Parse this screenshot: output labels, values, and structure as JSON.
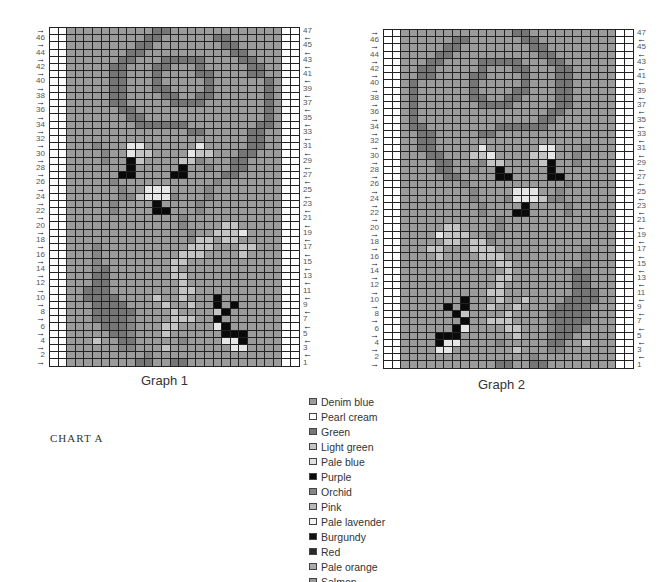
{
  "graphs": [
    {
      "id": "g1",
      "caption": "Graph 1",
      "left": 49,
      "mirror": false,
      "rows": [
        "aaaaaaaaaaddaaaaaaaaaaaaa",
        "aaaaaaaaaddaaaaaaddaaaaaa",
        "aaaaaaaaddaaaaaaaaddaaaaa",
        "aaaaaaaddaaaaaaaaaaddaaaa",
        "aaaaaaddaaadddddaaaaddaaa",
        "aaaaaddaaaddaaadaaaaaddaa",
        "aaaaaddaaadaaaaddaaaaddaa",
        "aaaaaddaaadaaaaadaaaaaada",
        "aaaaaddaaaddaaaadaaaaaada",
        "aaaaaddaaaaddaaddaaaaaada",
        "aaaaaddaaaaaddddaaaaaaada",
        "aaaaaaddaaaaaaaaaaaaaaada",
        "aaaaaaaddaaaaaaaaaaaaaada",
        "aaaaaaaaddddddaaaaaaaadda",
        "aaaaaaaaaaaaaaddaaaaaddaa",
        "aaaaaaaaaaaaaaaaaaaaaddaa",
        "aaamaaawwaaaaaawaaaaaddaa",
        "aaaamaawllaaaawllaaaddaaa",
        "aaaamaaklaaaallmaaaddaaaa",
        "aaaaaaakaaaaakaamaaddaaaa",
        "aaaaaakkaaaakkaaaaddaaaaa",
        "aaaaamaaaaaaaaaaamaaaaaaa",
        "aaaaaamaawwwaaaamaaaaaaaa",
        "aaaaaammlwwwmaaamaaaaaaaa",
        "aaaaamaaaakaaaamaaaaaaaaa",
        "aaaaamaaaakkaaamaaaaaaaaa",
        "aaaaaaaaaaaaamaaaaaaaaaaa",
        "aaaaaaaaaaaaamaaaallaaaaa",
        "aaaaaaaaaaaaaamaalllwaaaa",
        "aaaaaaaaaaaaaamllallaaaaa",
        "aaamaaaaaaaaaalllaaallaaa",
        "aaamaaaaaaaaalllaaaalaaaa",
        "aaamaaaaaaaallaaaaaaaaaaa",
        "aaamdaaaaaaalaaaaaaaaaaaa",
        "aaaddaaaaaaallaaaaaaaaaaa",
        "aaaddaaaaaaaalaaaaaaaaaaa",
        "aadddaaaaaaaallaaaaaaaaaa",
        "aaddddaaaalaalaaakaaaaaaa",
        "aaaddddaaaalaalaakakaaaaa",
        "aaadddddaaaalaaaalkaaaaaa",
        "aaaddddmaaaalllaakaaaaaaa",
        "aaaadddmaaallaaaawkaaaaaa",
        "aaaaaddmaaalaaaaaakkkaaaa",
        "aaalaaddaaaaamaaaawwkaaaa",
        "aaaaaammaaalaaaaaaawwaaaa",
        "aaaaaaaaamaaaaaaaaaaaaaaa",
        "aaaaaaaaddaaddaaaaaaaaaaa"
      ]
    },
    {
      "id": "g2",
      "caption": "Graph 2",
      "left": 383,
      "mirror": true
    }
  ],
  "left_labels": [
    "46",
    "44",
    "42",
    "40",
    "38",
    "36",
    "34",
    "32",
    "30",
    "28",
    "26",
    "24",
    "22",
    "20",
    "18",
    "16",
    "14",
    "12",
    "10",
    "8",
    "6",
    "4",
    "2"
  ],
  "right_labels": [
    "47",
    "45",
    "43",
    "41",
    "39",
    "37",
    "35",
    "33",
    "31",
    "29",
    "27",
    "25",
    "23",
    "21",
    "19",
    "17",
    "15",
    "13",
    "11",
    "9",
    "7",
    "5",
    "3",
    "1"
  ],
  "arrow_right": "→",
  "arrow_left": "←",
  "chart_title": "CHART A",
  "cell_colors": {
    "a": "#9b9b9b",
    "d": "#767676",
    "m": "#868686",
    "l": "#c4c4c4",
    "w": "#e6e6e6",
    "k": "#0a0a0a",
    "e": "#ffffff"
  },
  "legend": [
    {
      "label": "Denim blue",
      "color": "#9b9b9b"
    },
    {
      "label": "Pearl cream",
      "color": "#ffffff"
    },
    {
      "label": "Green",
      "color": "#767676"
    },
    {
      "label": "Light green",
      "color": "#c4c4c4"
    },
    {
      "label": "Pale blue",
      "color": "#e0e0e0"
    },
    {
      "label": "Purple",
      "color": "#0a0a0a"
    },
    {
      "label": "Orchid",
      "color": "#868686"
    },
    {
      "label": "Pink",
      "color": "#b8b8b8"
    },
    {
      "label": "Pale lavender",
      "color": "#f2f2f2"
    },
    {
      "label": "Burgundy",
      "color": "#111111"
    },
    {
      "label": "Red",
      "color": "#2a2a2a"
    },
    {
      "label": "Pale orange",
      "color": "#aaaaaa"
    },
    {
      "label": "Salmon",
      "color": "#999999"
    }
  ]
}
